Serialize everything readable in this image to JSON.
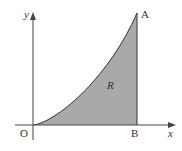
{
  "diagram": {
    "axis_labels": {
      "x": "x",
      "y": "y"
    },
    "points": {
      "origin": "O",
      "A": "A",
      "B": "B"
    },
    "region_label": "R",
    "colors": {
      "fill": "#a9a9a9",
      "stroke": "#333333",
      "axis": "#444444"
    }
  }
}
